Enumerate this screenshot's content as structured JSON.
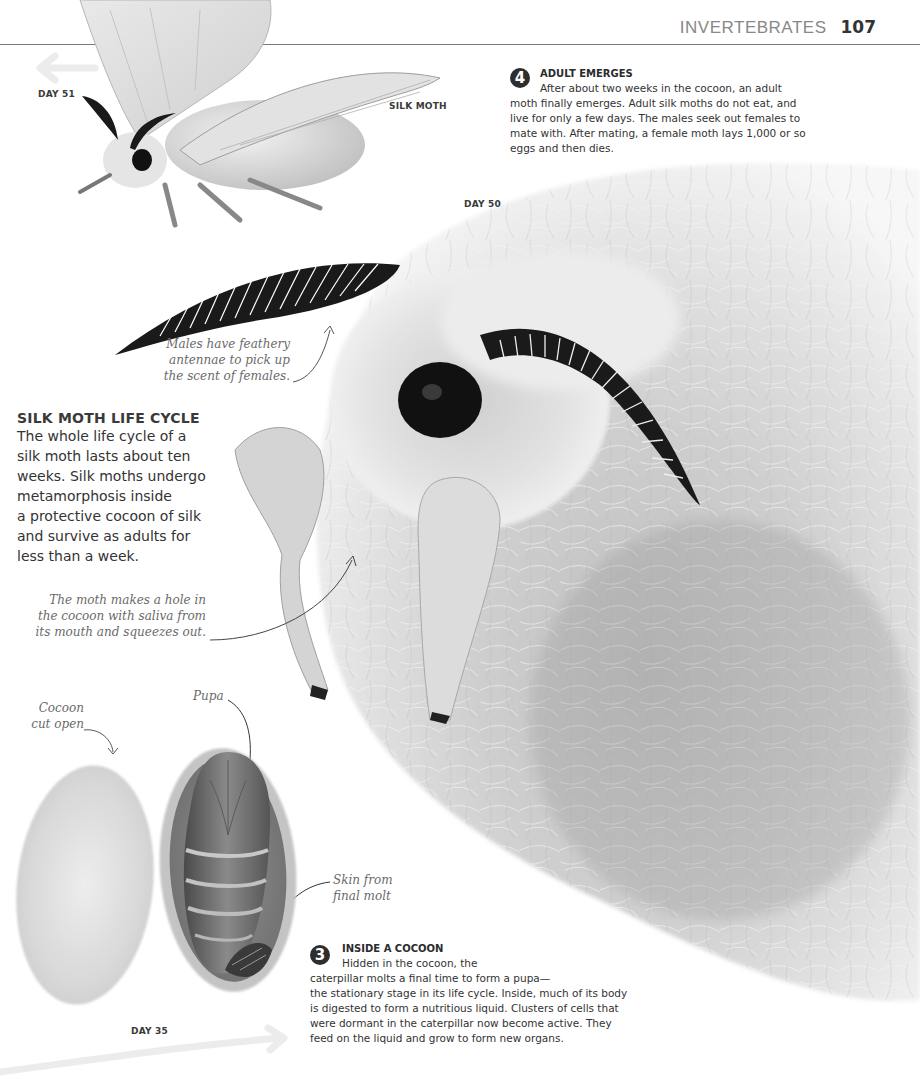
{
  "header": {
    "running_head": "INVERTEBRATES",
    "page_number": "107"
  },
  "labels": {
    "day51": "DAY 51",
    "silk_moth": "SILK MOTH",
    "day50": "DAY 50",
    "day35": "DAY 35"
  },
  "steps": [
    {
      "number": "4",
      "title": "ADULT EMERGES",
      "text": "After about two weeks in the cocoon, an adult moth finally emerges. Adult silk moths do not eat, and live for only a few days. The males seek out females to mate with. After mating, a female moth lays 1,000 or so eggs and then dies."
    },
    {
      "number": "3",
      "title": "INSIDE A COCOON",
      "text_lines": [
        "Hidden in the cocoon, the",
        "caterpillar molts a final time to form a pupa—",
        "the stationary stage in its life cycle. Inside, much of its body",
        "is digested to form a nutritious liquid. Clusters of cells that",
        "were dormant in the caterpillar now become active. They",
        "feed on the liquid and grow to form new organs."
      ]
    }
  ],
  "intro": {
    "title": "SILK MOTH LIFE CYCLE",
    "lines": [
      "The whole life cycle of a",
      "silk moth lasts about ten",
      "weeks. Silk moths undergo",
      "metamorphosis inside",
      "a protective cocoon of silk",
      "and survive as adults for",
      "less than a week."
    ]
  },
  "annotations": {
    "antennae": [
      "Males have feathery",
      "antennae to pick up",
      "the scent of females."
    ],
    "hole": [
      "The moth makes a hole in",
      "the cocoon with saliva from",
      "its mouth and squeezes out."
    ],
    "cocoon_cut": [
      "Cocoon",
      "cut open"
    ],
    "pupa": "Pupa",
    "skin": [
      "Skin from",
      "final molt"
    ]
  },
  "images": {
    "adult_moth": "silk-moth-full-body-photo",
    "moth_closeup": "moth-emerging-from-cocoon-closeup-photo",
    "cocoon_open": "cocoon-cut-open-with-pupa-photo"
  }
}
